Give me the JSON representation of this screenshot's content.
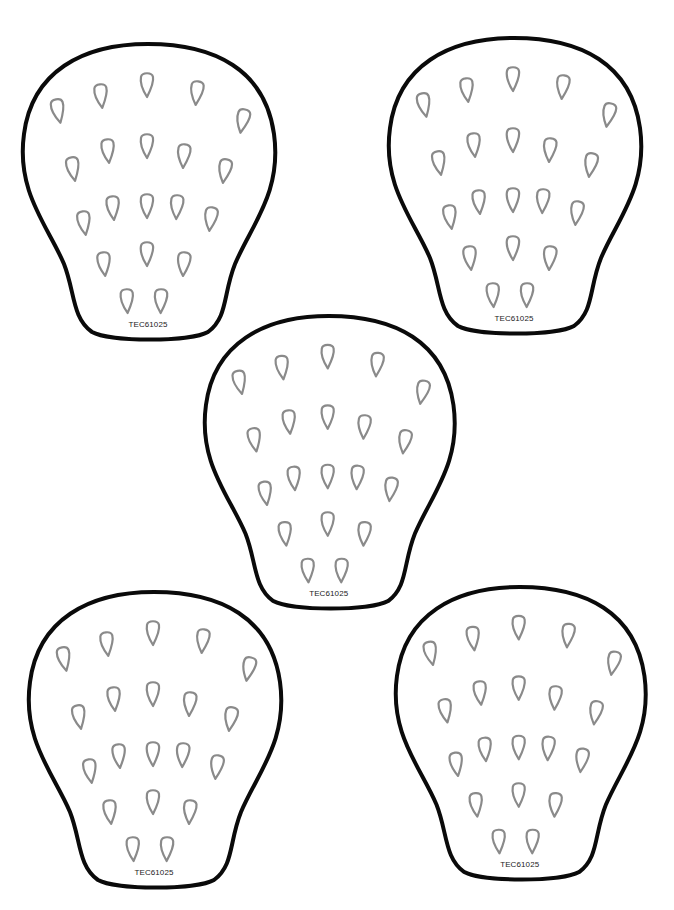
{
  "worksheet": {
    "strawberries": [
      {
        "label": "TEC61025",
        "x": 20,
        "y": 42,
        "scale": 1.0
      },
      {
        "label": "TEC61025",
        "x": 386,
        "y": 36,
        "scale": 1.0
      },
      {
        "label": "TEC61025",
        "x": 202,
        "y": 314,
        "scale": 0.99
      },
      {
        "label": "TEC61025",
        "x": 26,
        "y": 590,
        "scale": 1.0
      },
      {
        "label": "TEC61025",
        "x": 393,
        "y": 585,
        "scale": 0.99
      }
    ],
    "seed_positions": [
      [
        38,
        68
      ],
      [
        81,
        53
      ],
      [
        127,
        42
      ],
      [
        177,
        50
      ],
      [
        223,
        78
      ],
      [
        53,
        126
      ],
      [
        88,
        108
      ],
      [
        127,
        103
      ],
      [
        164,
        113
      ],
      [
        205,
        128
      ],
      [
        64,
        180
      ],
      [
        93,
        165
      ],
      [
        127,
        163
      ],
      [
        157,
        164
      ],
      [
        191,
        176
      ],
      [
        84,
        221
      ],
      [
        127,
        211
      ],
      [
        164,
        221
      ],
      [
        107,
        258
      ],
      [
        141,
        258
      ]
    ],
    "colors": {
      "outline": "#0a0a0a",
      "seed": "#8a8a8a",
      "background": "#ffffff"
    }
  }
}
